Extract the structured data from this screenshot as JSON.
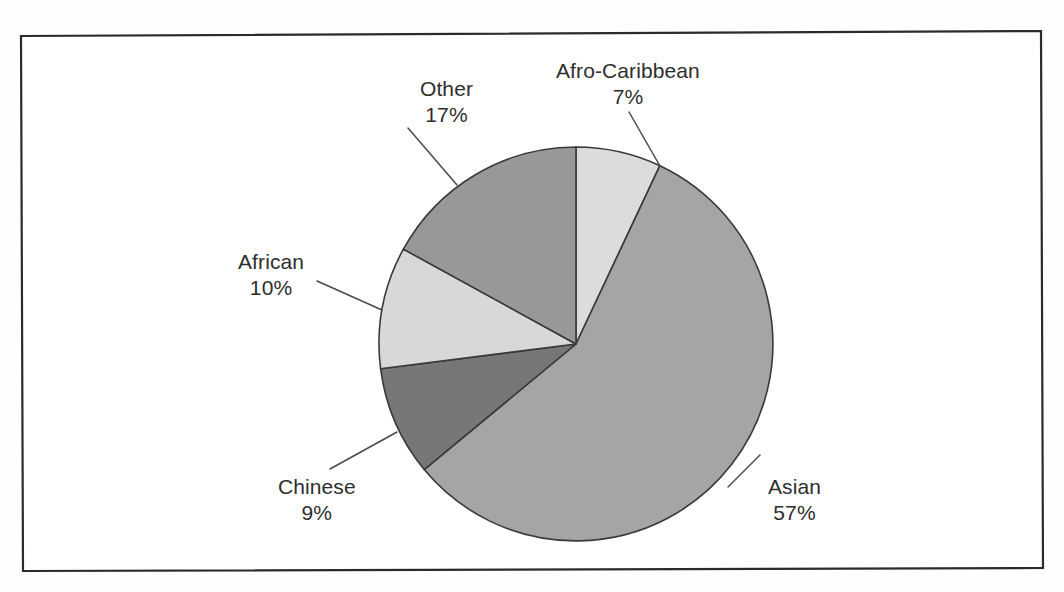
{
  "figure": {
    "background_color": "#ffffff",
    "frame_color": "#2b2b2b",
    "label_text_color": "#2e2e2e",
    "leader_line_color": "#4a4a4a"
  },
  "chart_data": {
    "type": "pie",
    "title": "",
    "subtitle": "",
    "xlabel": "",
    "ylabel": "",
    "legend_position": "none",
    "grid": false,
    "start_angle_deg": 0,
    "direction": "clockwise",
    "units": "percent",
    "total": 100,
    "categories": [
      "Afro-Caribbean",
      "Asian",
      "Chinese",
      "African",
      "Other"
    ],
    "values": [
      7,
      57,
      9,
      10,
      17
    ],
    "colors": [
      "#dcdcdc",
      "#a5a5a5",
      "#777777",
      "#d8d8d8",
      "#989898"
    ],
    "slices": [
      {
        "label": "Afro-Caribbean",
        "value": 7,
        "value_text": "7%",
        "color": "#dcdcdc",
        "start_deg": 0,
        "end_deg": 25.2
      },
      {
        "label": "Asian",
        "value": 57,
        "value_text": "57%",
        "color": "#a5a5a5",
        "start_deg": 25.2,
        "end_deg": 230.4
      },
      {
        "label": "Chinese",
        "value": 9,
        "value_text": "9%",
        "color": "#777777",
        "start_deg": 230.4,
        "end_deg": 262.8
      },
      {
        "label": "African",
        "value": 10,
        "value_text": "10%",
        "color": "#d8d8d8",
        "start_deg": 262.8,
        "end_deg": 298.8
      },
      {
        "label": "Other",
        "value": 17,
        "value_text": "17%",
        "color": "#989898",
        "start_deg": 298.8,
        "end_deg": 360
      }
    ]
  },
  "labels": {
    "afro_caribbean": {
      "name": "Afro-Caribbean",
      "value": "7%"
    },
    "asian": {
      "name": "Asian",
      "value": "57%"
    },
    "chinese": {
      "name": "Chinese",
      "value": "9%"
    },
    "african": {
      "name": "African",
      "value": "10%"
    },
    "other": {
      "name": "Other",
      "value": "17%"
    }
  }
}
